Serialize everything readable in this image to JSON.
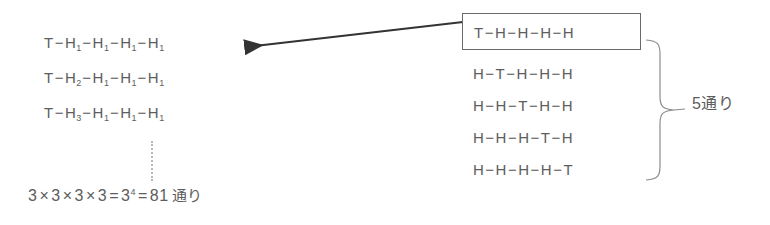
{
  "diagram": {
    "background_color": "#ffffff",
    "ink_color": "#5d5d5d",
    "box_border_color": "#6a6a6a",
    "left_group": {
      "rows": [
        {
          "id": "row-1",
          "parts": [
            "T",
            "H1",
            "H1",
            "H1",
            "H1"
          ],
          "text": "T−H1−H1−H1−H1"
        },
        {
          "id": "row-2",
          "parts": [
            "T",
            "H2",
            "H1",
            "H1",
            "H1"
          ],
          "text": "T−H2−H1−H1−H1"
        },
        {
          "id": "row-3",
          "parts": [
            "T",
            "H3",
            "H1",
            "H1",
            "H1"
          ],
          "text": "T−H3−H1−H1−H1"
        }
      ],
      "continuation": "vertical-dotted-line",
      "formula": {
        "factors": [
          "3",
          "3",
          "3",
          "3"
        ],
        "operator": "×",
        "equals": "=",
        "power_base": "3",
        "power_exponent": "4",
        "result": "81",
        "unit": "通り",
        "text": "3×3×3×3=3⁴=81通り"
      }
    },
    "right_group": {
      "boxed_row": {
        "id": "boxed-row",
        "parts": [
          "T",
          "H",
          "H",
          "H",
          "H"
        ],
        "text": "T−H−H−H−H"
      },
      "rows": [
        {
          "id": "row-2",
          "parts": [
            "H",
            "T",
            "H",
            "H",
            "H"
          ],
          "text": "H−T−H−H−H"
        },
        {
          "id": "row-3",
          "parts": [
            "H",
            "H",
            "T",
            "H",
            "H"
          ],
          "text": "H−H−T−H−H"
        },
        {
          "id": "row-4",
          "parts": [
            "H",
            "H",
            "H",
            "T",
            "H"
          ],
          "text": "H−H−H−T−H"
        },
        {
          "id": "row-5",
          "parts": [
            "H",
            "H",
            "H",
            "H",
            "T"
          ],
          "text": "H−H−H−H−T"
        }
      ],
      "brace_label": {
        "count": "5",
        "unit": "通り",
        "text": "5通り"
      }
    },
    "dash": "−"
  }
}
